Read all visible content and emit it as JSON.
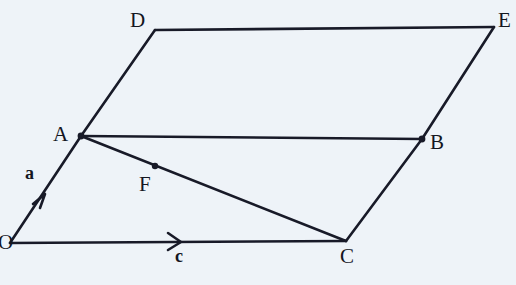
{
  "figure": {
    "kind": "vector-parallelogram-diagram",
    "background_color": "#eef3f8",
    "stroke_color": "#181a28",
    "stroke_width": 2.6,
    "canvas": {
      "width": 516,
      "height": 285
    },
    "vertices": [
      {
        "id": "O",
        "label": "O",
        "x": 10,
        "y": 243,
        "label_x": -2,
        "label_y": 234,
        "dot": false
      },
      {
        "id": "A",
        "label": "A",
        "x": 81,
        "y": 136,
        "label_x": 53,
        "label_y": 124,
        "dot": true
      },
      {
        "id": "B",
        "label": "B",
        "x": 422,
        "y": 139,
        "label_x": 431,
        "label_y": 133,
        "dot": true
      },
      {
        "id": "C",
        "label": "C",
        "x": 346,
        "y": 241,
        "label_x": 341,
        "label_y": 246,
        "dot": false
      },
      {
        "id": "D",
        "label": "D",
        "x": 155,
        "y": 30,
        "label_x": 130,
        "label_y": 10,
        "dot": false
      },
      {
        "id": "E",
        "label": "E",
        "x": 494,
        "y": 27,
        "label_x": 498,
        "label_y": 10,
        "dot": false
      },
      {
        "id": "F",
        "label": "F",
        "x": 155,
        "y": 166,
        "label_x": 139,
        "label_y": 174,
        "dot": true
      }
    ],
    "edges": [
      {
        "id": "edge-OA",
        "from": "O",
        "to": "A"
      },
      {
        "id": "edge-AD",
        "from": "A",
        "to": "D"
      },
      {
        "id": "edge-DE",
        "from": "D",
        "to": "E"
      },
      {
        "id": "edge-EB",
        "from": "E",
        "to": "B"
      },
      {
        "id": "edge-AB",
        "from": "A",
        "to": "B"
      },
      {
        "id": "edge-BC",
        "from": "B",
        "to": "C"
      },
      {
        "id": "edge-OC",
        "from": "O",
        "to": "C"
      },
      {
        "id": "edge-AC",
        "from": "A",
        "to": "C"
      }
    ],
    "vectors": [
      {
        "id": "vector-a",
        "label": "a",
        "on_edge": "edge-OA",
        "arrow_x": 45,
        "arrow_y": 196,
        "arrow_angle_deg": -56.4,
        "label_x": 25,
        "label_y": 164
      },
      {
        "id": "vector-c",
        "label": "c",
        "on_edge": "edge-OC",
        "arrow_x": 180,
        "arrow_y": 242,
        "arrow_angle_deg": -0.3,
        "label_x": 175,
        "label_y": 246
      }
    ]
  }
}
